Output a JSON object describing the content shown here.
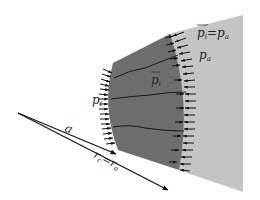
{
  "diagram": {
    "type": "cross-section of cylindrical/spherical shell with pressure arrows",
    "colors": {
      "background": "#ffffff",
      "outer_region": "#c4c4c4",
      "shell": "#6e6e6e",
      "arrows": "#111111",
      "cracks": "#111111",
      "text": "#222222"
    },
    "labels": {
      "pi_bar_eq_pa": "p̄ᵢ = pₐ",
      "pa": "pₐ",
      "pi_bar": "p̄ᵢ",
      "pi": "pᵢ",
      "a": "a",
      "rc_eq_ra": "r꜀ = rₐ"
    },
    "label_parts": {
      "pi_bar_eq_pa": {
        "left": "p",
        "left_sub": "i",
        "eq": "=",
        "right": "p",
        "right_sub": "a"
      },
      "pa": {
        "main": "p",
        "sub": "a"
      },
      "pi_bar": {
        "main": "p",
        "sub": "i"
      },
      "pi": {
        "main": "p",
        "sub": "i"
      },
      "a": {
        "main": "a"
      },
      "rc_eq_ra": {
        "left": "r",
        "left_sub": "c",
        "eq": "=",
        "right": "r",
        "right_sub": "a"
      }
    }
  }
}
